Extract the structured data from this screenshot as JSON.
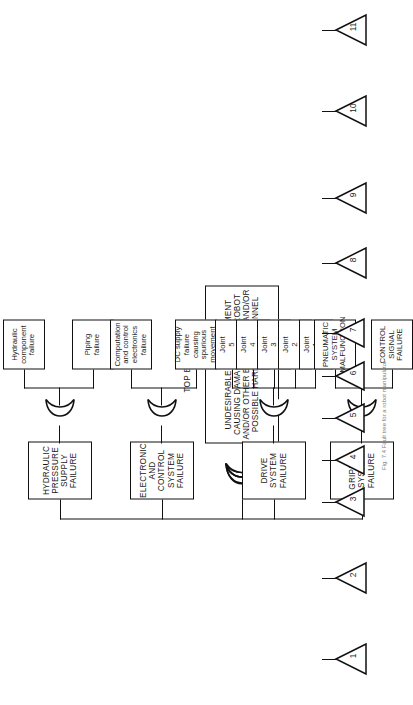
{
  "diagram": {
    "title": "TOP EVENT 1",
    "type": "fault-tree",
    "orientation": "rotated-90",
    "top_event": {
      "label": "UNDESIRABLE ARM MOVEMENT CAUSING DAMAGE TO THE ROBOT AND/OR OTHER EQUIPMENT AND/OR POSSIBLE HARM TO PERSONNEL",
      "lines": [
        "UNDESIRABLE ARM MOVEMENT",
        "CAUSING DAMAGE TO THE ROBOT",
        "AND/OR OTHER EQUIPMENT AND/OR",
        "POSSIBLE HARM TO PERSONNEL"
      ],
      "gate": "OR"
    },
    "intermediate_events": [
      {
        "id": "gripper",
        "lines": [
          "GRIPPER",
          "SYSTEM",
          "FAILURE"
        ],
        "label": "GRIPPER SYSTEM FAILURE",
        "gate": "OR"
      },
      {
        "id": "drive",
        "lines": [
          "DRIVE",
          "SYSTEM",
          "FAILURE"
        ],
        "label": "DRIVE SYSTEM FAILURE",
        "gate": "OR"
      },
      {
        "id": "electronic",
        "lines": [
          "ELECTRONIC",
          "AND CONTROL",
          "SYSTEM",
          "FAILURE"
        ],
        "label": "ELECTRONIC AND CONTROL SYSTEM FAILURE",
        "gate": "OR"
      },
      {
        "id": "hydraulic",
        "lines": [
          "HYDRAULIC",
          "PRESSURE",
          "SUPPLY",
          "FAILURE"
        ],
        "label": "HYDRAULIC PRESSURE SUPPLY FAILURE",
        "gate": "OR"
      }
    ],
    "basic_events": [
      {
        "transfer": "1",
        "parent": "gripper",
        "case": "upper",
        "lines": [
          "CONTROL",
          "SIGNAL",
          "FAILURE"
        ],
        "label": "CONTROL SIGNAL FAILURE"
      },
      {
        "transfer": "2",
        "parent": "gripper",
        "case": "upper",
        "lines": [
          "PNEUMATIC",
          "SYSTEM",
          "MALFUNCTION"
        ],
        "label": "PNEUMATIC SYSTEM MALFUNCTION"
      },
      {
        "transfer": "3",
        "parent": "drive",
        "case": "lower",
        "lines": [
          "Joint",
          "1",
          "failure"
        ],
        "label": "Joint 1 failure"
      },
      {
        "transfer": "4",
        "parent": "drive",
        "case": "lower",
        "lines": [
          "Joint",
          "2",
          "failure"
        ],
        "label": "Joint 2 failure"
      },
      {
        "transfer": "5",
        "parent": "drive",
        "case": "lower",
        "lines": [
          "Joint",
          "3",
          "failure"
        ],
        "label": "Joint 3 failure"
      },
      {
        "transfer": "6",
        "parent": "drive",
        "case": "lower",
        "lines": [
          "Joint",
          "4",
          "failure"
        ],
        "label": "Joint 4 failure"
      },
      {
        "transfer": "7",
        "parent": "drive",
        "case": "lower",
        "lines": [
          "Joint",
          "5",
          "failure"
        ],
        "label": "Joint 5 failure"
      },
      {
        "transfer": "8",
        "parent": "electronic",
        "case": "lower",
        "lines": [
          "DC supply",
          "failure causing",
          "spurious",
          "movement"
        ],
        "label": "DC supply failure causing spurious movement"
      },
      {
        "transfer": "9",
        "parent": "electronic",
        "case": "lower",
        "lines": [
          "Computation",
          "and control",
          "electronics",
          "failure"
        ],
        "label": "Computation and control electronics failure"
      },
      {
        "transfer": "10",
        "parent": "hydraulic",
        "case": "lower",
        "lines": [
          "Piping",
          "failure"
        ],
        "label": "Piping failure"
      },
      {
        "transfer": "11",
        "parent": "hydraulic",
        "case": "lower",
        "lines": [
          "Hydraulic",
          "component",
          "failure"
        ],
        "label": "Hydraulic component failure"
      }
    ],
    "caption": "Fig. 7.4  Fault tree for a robot manipulator"
  },
  "colors": {
    "line": "#111111",
    "background": "#ffffff",
    "text": "#1a1a1a"
  }
}
